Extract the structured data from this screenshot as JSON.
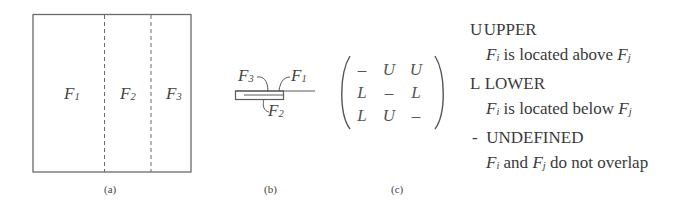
{
  "panel_a": {
    "caption": "(a)",
    "faces": [
      {
        "name": "F",
        "sub": "1"
      },
      {
        "name": "F",
        "sub": "2"
      },
      {
        "name": "F",
        "sub": "3"
      }
    ]
  },
  "panel_b": {
    "caption": "(b)",
    "labels": [
      {
        "name": "F",
        "sub": "3"
      },
      {
        "name": "F",
        "sub": "1"
      },
      {
        "name": "F",
        "sub": "2"
      }
    ]
  },
  "panel_c": {
    "caption": "(c)",
    "matrix": [
      [
        "–",
        "U",
        "U"
      ],
      [
        "L",
        "–",
        "L"
      ],
      [
        "L",
        "U",
        "–"
      ]
    ]
  },
  "legend": {
    "items": [
      {
        "symbol": "U",
        "title": "UPPER",
        "desc_pre": "",
        "fi": "F",
        "fi_sub": "i",
        "desc_mid": " is located above ",
        "fj": "F",
        "fj_sub": "j",
        "desc_post": ""
      },
      {
        "symbol": "L",
        "title": "LOWER",
        "desc_pre": "",
        "fi": "F",
        "fi_sub": "i",
        "desc_mid": " is located below ",
        "fj": "F",
        "fj_sub": "j",
        "desc_post": ""
      },
      {
        "symbol": "-",
        "title": "UNDEFINED",
        "desc_pre": "",
        "fi": "F",
        "fi_sub": "i",
        "desc_mid": " and ",
        "fj": "F",
        "fj_sub": "j",
        "desc_post": " do not overlap"
      }
    ]
  }
}
